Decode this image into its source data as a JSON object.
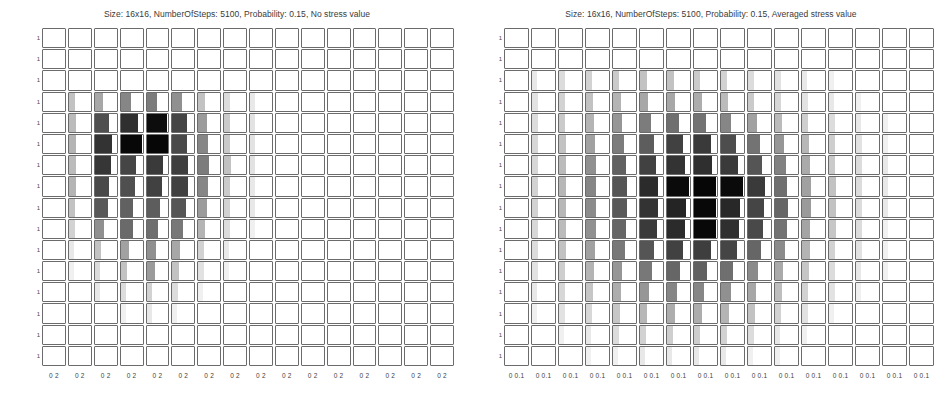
{
  "figure": {
    "panel_count": 2,
    "grid_rows": 16,
    "grid_cols": 16
  },
  "panels": [
    {
      "id": "no-stress-value",
      "title": "Size: 16x16, NumberOfSteps: 5100, Probability: 0.15, No stress value",
      "ytick_label": "1",
      "xtick_label_low": "0",
      "xtick_label_high": "2"
    },
    {
      "id": "averaged-stress-value",
      "title": "Size: 16x16, NumberOfSteps: 5100, Probability: 0.15, Averaged stress value",
      "ytick_label": "1",
      "xtick_label_low": "0",
      "xtick_label_high": "0.1"
    }
  ],
  "chart_data": [
    {
      "type": "heatmap",
      "title": "Size: 16x16, NumberOfSteps: 5100, Probability: 0.15, No stress value",
      "xlabel": "",
      "ylabel": "",
      "grid": true,
      "legend": "none",
      "rows": 16,
      "cols": 16,
      "xlim": [
        0,
        2
      ],
      "ylim": [
        0,
        1
      ],
      "xtick_labels": [
        "0",
        "2"
      ],
      "ytick_labels": [
        "1"
      ],
      "cell_subplot_type": "bar",
      "note": "Each grid cell is a miniature bar/histogram subplot; cell value encodes bar darkness and bar width (fraction of cell filled).",
      "values": [
        [
          0.0,
          0.0,
          0.0,
          0.0,
          0.0,
          0.0,
          0.0,
          0.0,
          0.0,
          0.0,
          0.0,
          0.0,
          0.0,
          0.0,
          0.0,
          0.0
        ],
        [
          0.0,
          0.0,
          0.0,
          0.0,
          0.0,
          0.0,
          0.0,
          0.0,
          0.0,
          0.0,
          0.0,
          0.0,
          0.0,
          0.0,
          0.0,
          0.0
        ],
        [
          0.0,
          0.0,
          0.0,
          0.0,
          0.0,
          0.0,
          0.0,
          0.0,
          0.0,
          0.0,
          0.0,
          0.0,
          0.0,
          0.0,
          0.0,
          0.0
        ],
        [
          0.0,
          0.1,
          0.18,
          0.3,
          0.34,
          0.26,
          0.1,
          0.04,
          0.02,
          0.0,
          0.0,
          0.0,
          0.0,
          0.0,
          0.0,
          0.0
        ],
        [
          0.0,
          0.12,
          0.55,
          0.72,
          0.92,
          0.6,
          0.22,
          0.08,
          0.03,
          0.0,
          0.0,
          0.0,
          0.0,
          0.0,
          0.0,
          0.0
        ],
        [
          0.0,
          0.14,
          0.7,
          0.95,
          0.96,
          0.58,
          0.3,
          0.08,
          0.03,
          0.0,
          0.0,
          0.0,
          0.0,
          0.0,
          0.0,
          0.0
        ],
        [
          0.0,
          0.12,
          0.68,
          0.6,
          0.66,
          0.64,
          0.34,
          0.1,
          0.03,
          0.0,
          0.0,
          0.0,
          0.0,
          0.0,
          0.0,
          0.0
        ],
        [
          0.0,
          0.14,
          0.58,
          0.55,
          0.62,
          0.62,
          0.3,
          0.08,
          0.02,
          0.0,
          0.0,
          0.0,
          0.0,
          0.0,
          0.0,
          0.0
        ],
        [
          0.0,
          0.1,
          0.5,
          0.46,
          0.48,
          0.52,
          0.22,
          0.06,
          0.02,
          0.0,
          0.0,
          0.0,
          0.0,
          0.0,
          0.0,
          0.0
        ],
        [
          0.0,
          0.06,
          0.26,
          0.42,
          0.4,
          0.36,
          0.14,
          0.04,
          0.01,
          0.0,
          0.0,
          0.0,
          0.0,
          0.0,
          0.0,
          0.0
        ],
        [
          0.0,
          0.02,
          0.1,
          0.2,
          0.26,
          0.18,
          0.06,
          0.02,
          0.0,
          0.0,
          0.0,
          0.0,
          0.0,
          0.0,
          0.0,
          0.0
        ],
        [
          0.0,
          0.01,
          0.04,
          0.1,
          0.22,
          0.1,
          0.03,
          0.01,
          0.0,
          0.0,
          0.0,
          0.0,
          0.0,
          0.0,
          0.0,
          0.0
        ],
        [
          0.0,
          0.0,
          0.02,
          0.04,
          0.06,
          0.04,
          0.01,
          0.0,
          0.0,
          0.0,
          0.0,
          0.0,
          0.0,
          0.0,
          0.0,
          0.0
        ],
        [
          0.0,
          0.0,
          0.0,
          0.01,
          0.02,
          0.01,
          0.0,
          0.0,
          0.0,
          0.0,
          0.0,
          0.0,
          0.0,
          0.0,
          0.0,
          0.0
        ],
        [
          0.0,
          0.0,
          0.0,
          0.0,
          0.0,
          0.0,
          0.0,
          0.0,
          0.0,
          0.0,
          0.0,
          0.0,
          0.0,
          0.0,
          0.0,
          0.0
        ],
        [
          0.0,
          0.0,
          0.0,
          0.0,
          0.0,
          0.0,
          0.0,
          0.0,
          0.0,
          0.0,
          0.0,
          0.0,
          0.0,
          0.0,
          0.0,
          0.0
        ]
      ]
    },
    {
      "type": "heatmap",
      "title": "Size: 16x16, NumberOfSteps: 5100, Probability: 0.15, Averaged stress value",
      "xlabel": "",
      "ylabel": "",
      "grid": true,
      "legend": "none",
      "rows": 16,
      "cols": 16,
      "xlim": [
        0,
        0.1
      ],
      "ylim": [
        0,
        1
      ],
      "xtick_labels": [
        "0",
        "0.1"
      ],
      "ytick_labels": [
        "1"
      ],
      "cell_subplot_type": "bar",
      "note": "Each grid cell is a miniature bar/histogram subplot; cell value encodes bar darkness and bar width (fraction of cell filled).",
      "values": [
        [
          0.0,
          0.0,
          0.0,
          0.0,
          0.0,
          0.0,
          0.0,
          0.0,
          0.0,
          0.0,
          0.0,
          0.0,
          0.0,
          0.0,
          0.0,
          0.0
        ],
        [
          0.0,
          0.0,
          0.0,
          0.0,
          0.0,
          0.0,
          0.0,
          0.0,
          0.0,
          0.0,
          0.0,
          0.0,
          0.0,
          0.0,
          0.0,
          0.0
        ],
        [
          0.0,
          0.02,
          0.04,
          0.06,
          0.08,
          0.1,
          0.1,
          0.08,
          0.06,
          0.04,
          0.03,
          0.02,
          0.01,
          0.0,
          0.0,
          0.0
        ],
        [
          0.0,
          0.03,
          0.06,
          0.1,
          0.14,
          0.18,
          0.18,
          0.16,
          0.12,
          0.08,
          0.05,
          0.03,
          0.02,
          0.01,
          0.0,
          0.0
        ],
        [
          0.0,
          0.04,
          0.08,
          0.14,
          0.24,
          0.34,
          0.4,
          0.38,
          0.3,
          0.2,
          0.12,
          0.07,
          0.04,
          0.02,
          0.01,
          0.0
        ],
        [
          0.0,
          0.05,
          0.1,
          0.2,
          0.34,
          0.48,
          0.62,
          0.66,
          0.56,
          0.38,
          0.24,
          0.13,
          0.07,
          0.03,
          0.01,
          0.0
        ],
        [
          0.0,
          0.05,
          0.12,
          0.26,
          0.46,
          0.62,
          0.7,
          0.72,
          0.66,
          0.52,
          0.32,
          0.17,
          0.08,
          0.04,
          0.02,
          0.0
        ],
        [
          0.0,
          0.06,
          0.13,
          0.3,
          0.52,
          0.74,
          0.94,
          0.96,
          0.94,
          0.66,
          0.4,
          0.2,
          0.1,
          0.04,
          0.02,
          0.0
        ],
        [
          0.0,
          0.06,
          0.13,
          0.28,
          0.5,
          0.7,
          0.78,
          0.95,
          0.76,
          0.6,
          0.44,
          0.22,
          0.1,
          0.04,
          0.02,
          0.0
        ],
        [
          0.0,
          0.05,
          0.12,
          0.26,
          0.44,
          0.66,
          0.74,
          0.95,
          0.72,
          0.58,
          0.38,
          0.19,
          0.09,
          0.04,
          0.01,
          0.0
        ],
        [
          0.0,
          0.04,
          0.1,
          0.2,
          0.36,
          0.52,
          0.62,
          0.64,
          0.6,
          0.44,
          0.28,
          0.14,
          0.06,
          0.03,
          0.01,
          0.0
        ],
        [
          0.0,
          0.03,
          0.07,
          0.14,
          0.24,
          0.36,
          0.44,
          0.46,
          0.4,
          0.28,
          0.17,
          0.09,
          0.04,
          0.02,
          0.01,
          0.0
        ],
        [
          0.0,
          0.02,
          0.05,
          0.09,
          0.16,
          0.24,
          0.3,
          0.3,
          0.26,
          0.18,
          0.11,
          0.06,
          0.03,
          0.01,
          0.0,
          0.0
        ],
        [
          0.0,
          0.01,
          0.03,
          0.05,
          0.09,
          0.13,
          0.16,
          0.16,
          0.14,
          0.1,
          0.06,
          0.03,
          0.01,
          0.0,
          0.0,
          0.0
        ],
        [
          0.0,
          0.0,
          0.01,
          0.02,
          0.04,
          0.06,
          0.07,
          0.07,
          0.06,
          0.04,
          0.02,
          0.01,
          0.0,
          0.0,
          0.0,
          0.0
        ],
        [
          0.0,
          0.0,
          0.0,
          0.01,
          0.01,
          0.02,
          0.02,
          0.02,
          0.02,
          0.01,
          0.01,
          0.0,
          0.0,
          0.0,
          0.0,
          0.0
        ]
      ]
    }
  ]
}
